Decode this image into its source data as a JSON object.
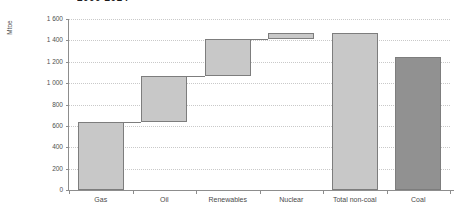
{
  "title": {
    "text": "2000-2014",
    "clipped": true
  },
  "chart_data": {
    "type": "bar",
    "subtype": "waterfall",
    "title": "2000-2014",
    "xlabel": "",
    "ylabel": "Mtoe",
    "ylim": [
      0,
      1600
    ],
    "ytick_step": 200,
    "ytick_labels": [
      "0",
      "200",
      "400",
      "600",
      "800",
      "1 000",
      "1 200",
      "1 400",
      "1 600"
    ],
    "ytick_values": [
      0,
      200,
      400,
      600,
      800,
      1000,
      1200,
      1400,
      1600
    ],
    "grid": true,
    "legend": "none",
    "thousands_separator": " ",
    "categories": [
      "Gas",
      "Oil",
      "Renewables",
      "Nuclear",
      "Total non-coal",
      "Coal"
    ],
    "bars": [
      {
        "label": "Gas",
        "base": 0,
        "top": 635,
        "value": 635,
        "kind": "increment",
        "color": "#c8c8c8"
      },
      {
        "label": "Oil",
        "base": 635,
        "top": 1070,
        "value": 435,
        "kind": "increment",
        "color": "#c8c8c8"
      },
      {
        "label": "Renewables",
        "base": 1070,
        "top": 1415,
        "value": 345,
        "kind": "increment",
        "color": "#c8c8c8"
      },
      {
        "label": "Nuclear",
        "base": 1415,
        "top": 1465,
        "value": 50,
        "kind": "increment",
        "color": "#c8c8c8"
      },
      {
        "label": "Total non-coal",
        "base": 0,
        "top": 1465,
        "value": 1465,
        "kind": "total",
        "color": "#c8c8c8"
      },
      {
        "label": "Coal",
        "base": 0,
        "top": 1245,
        "value": 1245,
        "kind": "total",
        "color": "#919191"
      }
    ],
    "colors": {
      "non_coal_bar": "#c8c8c8",
      "coal_bar": "#919191",
      "bar_outline": "#7d7d7d",
      "axis": "#8d8d8d",
      "gridline": "#c9c9c9",
      "text": "#4a4a4a"
    }
  }
}
